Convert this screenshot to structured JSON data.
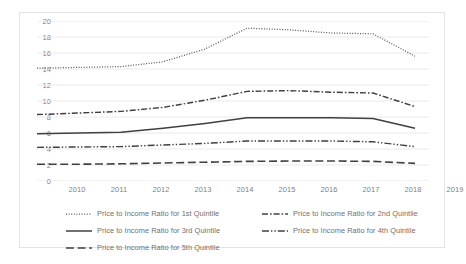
{
  "chart_data": {
    "type": "line",
    "title": "",
    "xlabel": "",
    "ylabel": "",
    "categories": [
      2010,
      2011,
      2012,
      2013,
      2014,
      2015,
      2016,
      2017,
      2018,
      2019
    ],
    "ylim": [
      0,
      20
    ],
    "ytick_step": 2,
    "yticks": [
      0,
      2,
      4,
      6,
      8,
      10,
      12,
      14,
      16,
      18,
      20
    ],
    "grid": "horizontal",
    "legend_position": "bottom",
    "series": [
      {
        "name": "Price to Income Ratio for 1st Quintile",
        "style": "dotted",
        "color": "#595959",
        "values": [
          14.1,
          14.2,
          14.3,
          14.9,
          16.5,
          19.1,
          18.9,
          18.5,
          18.4,
          15.6
        ]
      },
      {
        "name": "Price to Income Ratio for 2nd Quintile",
        "style": "dash-dot",
        "color": "#404040",
        "values": [
          8.3,
          8.5,
          8.7,
          9.2,
          10.1,
          11.2,
          11.3,
          11.1,
          11.0,
          9.3
        ]
      },
      {
        "name": "Price to Income Ratio for 3rd Quintile",
        "style": "solid",
        "color": "#404040",
        "values": [
          5.9,
          6.0,
          6.1,
          6.6,
          7.2,
          7.9,
          7.9,
          7.9,
          7.8,
          6.6
        ]
      },
      {
        "name": "Price to Income Ratio for 4th Quintile",
        "style": "dash-dot-dot",
        "color": "#404040",
        "values": [
          4.2,
          4.25,
          4.3,
          4.5,
          4.7,
          5.0,
          5.0,
          5.0,
          4.9,
          4.3
        ]
      },
      {
        "name": "Price to Income Ratio for 5th Quintile",
        "style": "long-dash",
        "color": "#404040",
        "values": [
          2.1,
          2.1,
          2.15,
          2.25,
          2.35,
          2.45,
          2.5,
          2.5,
          2.45,
          2.2
        ]
      }
    ]
  },
  "legend": {
    "entries": [
      "Price to Income Ratio for 1st Quintile",
      "Price to Income Ratio for 2nd Quintile",
      "Price to Income Ratio for 3rd Quintile",
      "Price to Income Ratio for 4th Quintile",
      "Price to Income Ratio for 5th Quintile"
    ]
  },
  "colors": {
    "grid": "#e8e8e8",
    "axis_text": "#7f7f7f",
    "legend_text": "#6f6f6f",
    "border": "#e3e3e3",
    "background": "#ffffff"
  }
}
